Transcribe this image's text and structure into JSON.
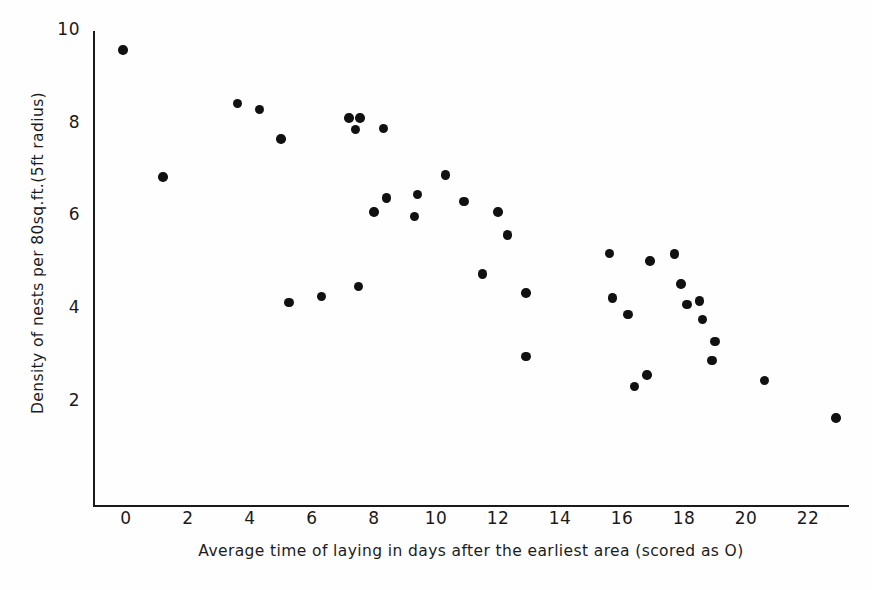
{
  "chart_data": {
    "type": "scatter",
    "title": "",
    "xlabel": "Average time of laying in days after the earliest area (scored as O)",
    "ylabel": "Density of nests per 80sq.ft.(5ft radius)",
    "xlim": [
      -0.6,
      23.6
    ],
    "ylim": [
      0.55,
      10.15
    ],
    "xticks_major": [
      0,
      2,
      4,
      6,
      8,
      10,
      12,
      14,
      16,
      18,
      20,
      22
    ],
    "xticks_minor": [
      1,
      3,
      5,
      7,
      9,
      11,
      13,
      15,
      17,
      19,
      21,
      23
    ],
    "xtick_labels": [
      "0",
      "2",
      "4",
      "6",
      "8",
      "10",
      "12",
      "14",
      "16",
      "18",
      "20",
      "22"
    ],
    "yticks_major": [
      2,
      4,
      6,
      8,
      10
    ],
    "yticks_minor": [
      1,
      1.5,
      2.5,
      3,
      3.5,
      4.5,
      5,
      5.5,
      6.5,
      7,
      7.5,
      8.5,
      9,
      9.5
    ],
    "ytick_labels": [
      "2",
      "4",
      "6",
      "8",
      "10"
    ],
    "grid": false,
    "legend": false,
    "marker": "filled-circle",
    "marker_color": "#111111",
    "axis_color": "#1a1a1a",
    "background_color": "#fefefe",
    "n_points": 40,
    "points": [
      {
        "x": -0.1,
        "y": 9.57
      },
      {
        "x": 1.2,
        "y": 6.83
      },
      {
        "x": 3.6,
        "y": 8.42
      },
      {
        "x": 4.3,
        "y": 8.28
      },
      {
        "x": 5.0,
        "y": 7.65
      },
      {
        "x": 5.25,
        "y": 4.12
      },
      {
        "x": 6.3,
        "y": 4.25
      },
      {
        "x": 7.2,
        "y": 8.1
      },
      {
        "x": 7.55,
        "y": 8.1
      },
      {
        "x": 7.4,
        "y": 7.85
      },
      {
        "x": 8.3,
        "y": 7.88
      },
      {
        "x": 7.5,
        "y": 4.46
      },
      {
        "x": 8.0,
        "y": 6.07
      },
      {
        "x": 8.4,
        "y": 6.37
      },
      {
        "x": 9.4,
        "y": 6.45
      },
      {
        "x": 9.3,
        "y": 5.97
      },
      {
        "x": 10.3,
        "y": 6.87
      },
      {
        "x": 10.9,
        "y": 6.3
      },
      {
        "x": 11.5,
        "y": 4.73
      },
      {
        "x": 12.0,
        "y": 6.07
      },
      {
        "x": 12.3,
        "y": 5.57
      },
      {
        "x": 12.9,
        "y": 4.32
      },
      {
        "x": 12.9,
        "y": 2.95
      },
      {
        "x": 15.6,
        "y": 5.18
      },
      {
        "x": 15.7,
        "y": 4.21
      },
      {
        "x": 16.2,
        "y": 3.86
      },
      {
        "x": 16.4,
        "y": 2.3
      },
      {
        "x": 16.8,
        "y": 2.55
      },
      {
        "x": 16.9,
        "y": 5.01
      },
      {
        "x": 17.7,
        "y": 5.16
      },
      {
        "x": 17.9,
        "y": 4.52
      },
      {
        "x": 18.1,
        "y": 4.07
      },
      {
        "x": 18.5,
        "y": 4.15
      },
      {
        "x": 18.6,
        "y": 3.75
      },
      {
        "x": 19.0,
        "y": 3.27
      },
      {
        "x": 18.9,
        "y": 2.86
      },
      {
        "x": 20.6,
        "y": 2.43
      },
      {
        "x": 22.9,
        "y": 1.62
      }
    ]
  },
  "axes": {
    "y_title": "Density of nests per 80sq.ft.(5ft radius)",
    "x_title": "Average time of laying in days after the earliest area (scored as O)"
  }
}
